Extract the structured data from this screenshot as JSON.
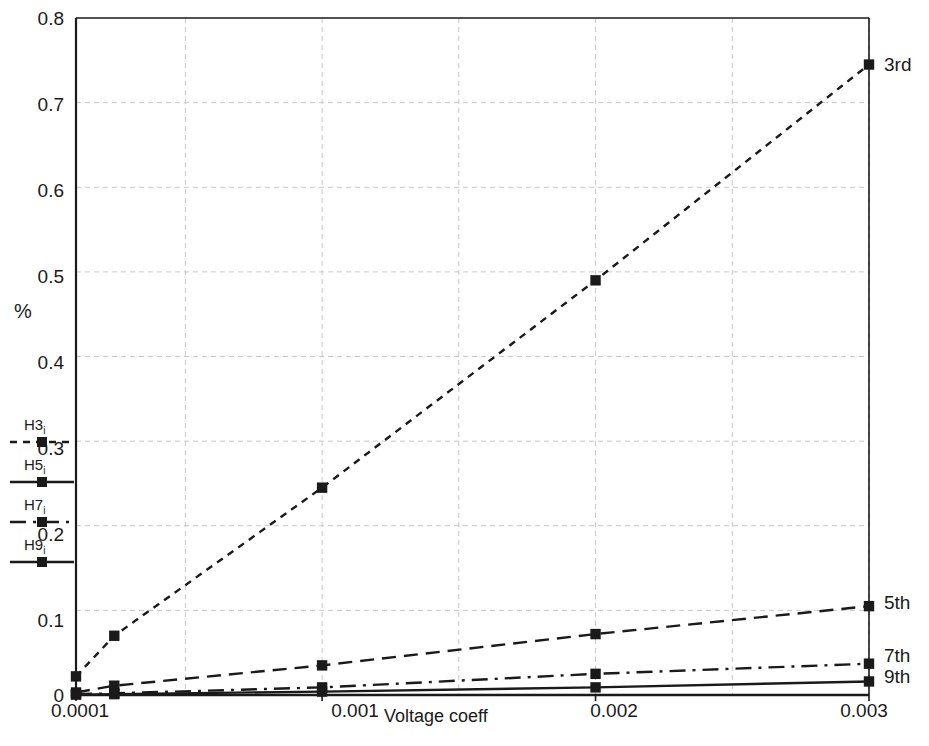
{
  "chart_data": {
    "type": "line",
    "title": "",
    "xlabel": "Voltage coeff",
    "ylabel": "%",
    "x_tick_labels": [
      "0.0001",
      "0.001",
      "0.002",
      "0.003"
    ],
    "x_tick_values": [
      0.0001,
      0.001,
      0.002,
      0.003
    ],
    "y_tick_labels": [
      "0",
      "0.1",
      "0.2",
      "0.3",
      "0.4",
      "0.5",
      "0.6",
      "0.7",
      "0.8"
    ],
    "y_tick_values": [
      0,
      0.1,
      0.2,
      0.3,
      0.4,
      0.5,
      0.6,
      0.7,
      0.8
    ],
    "xlim": [
      0.0001,
      0.003
    ],
    "ylim": [
      0,
      0.8
    ],
    "grid": true,
    "legend_position": "left-outside",
    "x": [
      0.0001,
      0.00024,
      0.001,
      0.002,
      0.003
    ],
    "series": [
      {
        "name": "H3i",
        "end_label": "3rd",
        "line_style": "dotted",
        "marker": "square",
        "values": [
          0.022,
          0.07,
          0.245,
          0.49,
          0.745
        ]
      },
      {
        "name": "H5i",
        "end_label": "5th",
        "line_style": "dashed",
        "marker": "square",
        "values": [
          0.003,
          0.011,
          0.035,
          0.072,
          0.105
        ]
      },
      {
        "name": "H7i",
        "end_label": "7th",
        "line_style": "dashdot",
        "marker": "square",
        "values": [
          0.001,
          0.002,
          0.009,
          0.025,
          0.037
        ]
      },
      {
        "name": "H9i",
        "end_label": "9th",
        "line_style": "solid",
        "marker": "square",
        "values": [
          0.0005,
          0.001,
          0.004,
          0.009,
          0.016
        ]
      }
    ]
  },
  "legend": {
    "items": [
      {
        "label_main": "H3",
        "label_sub": "i",
        "style": "dotted"
      },
      {
        "label_main": "H5",
        "label_sub": "i",
        "style": "solid"
      },
      {
        "label_main": "H7",
        "label_sub": "i",
        "style": "dashdot"
      },
      {
        "label_main": "H9",
        "label_sub": "i",
        "style": "solid"
      }
    ]
  },
  "colors": {
    "line": "#1a1a1a",
    "grid": "#c8c8c8",
    "axis": "#1a1a1a",
    "background": "#ffffff"
  },
  "ticks": {
    "y": [
      {
        "label": "0.8",
        "top": 8
      },
      {
        "label": "0.7",
        "top": 94
      },
      {
        "label": "0.6",
        "top": 180
      },
      {
        "label": "0.5",
        "top": 266
      },
      {
        "label": "0.4",
        "top": 352
      },
      {
        "label": "0.3",
        "top": 438
      },
      {
        "label": "0.2",
        "top": 524
      },
      {
        "label": "0.1",
        "top": 610
      },
      {
        "label": "0",
        "top": 685
      }
    ],
    "x": [
      {
        "label": "0.0001",
        "left": 25
      },
      {
        "label": "0.001",
        "left": 300
      },
      {
        "label": "0.002",
        "left": 559
      },
      {
        "label": "0.003",
        "left": 809
      }
    ]
  },
  "end_labels": [
    {
      "text": "3rd",
      "left": 884,
      "top": 54
    },
    {
      "text": "5th",
      "left": 884,
      "top": 592
    },
    {
      "text": "7th",
      "left": 884,
      "top": 645
    },
    {
      "text": "9th",
      "left": 884,
      "top": 666
    }
  ]
}
